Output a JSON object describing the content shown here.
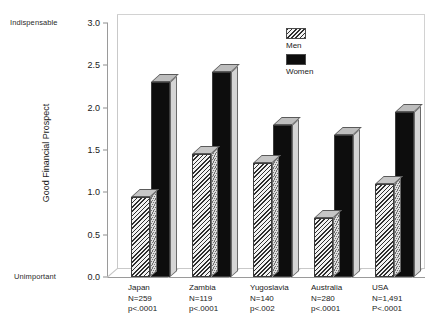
{
  "chart_data": {
    "type": "bar",
    "title": "",
    "xlabel": "",
    "ylabel": "Good Financial Prospect",
    "ylim": [
      0.0,
      3.0
    ],
    "ytick_labels": [
      "0.0",
      "0.5",
      "1.0",
      "1.5",
      "2.0",
      "2.5",
      "3.0"
    ],
    "ytick_values": [
      0.0,
      0.5,
      1.0,
      1.5,
      2.0,
      2.5,
      3.0
    ],
    "axis_low_anchor": "Unimportant",
    "axis_high_anchor": "Indispensable",
    "grid": false,
    "legend_position": "top-center-right",
    "categories": [
      "Japan",
      "Zambia",
      "Yugoslavia",
      "Australia",
      "USA"
    ],
    "series": [
      {
        "name": "Men",
        "values": [
          0.95,
          1.45,
          1.35,
          0.7,
          1.1
        ]
      },
      {
        "name": "Women",
        "values": [
          2.3,
          2.42,
          1.8,
          1.68,
          1.95
        ]
      }
    ],
    "annotations": [
      {
        "category": "Japan",
        "n": "N=259",
        "p": "p<.0001"
      },
      {
        "category": "Zambia",
        "n": "N=119",
        "p": "p<.0001"
      },
      {
        "category": "Yugoslavia",
        "n": "N=140",
        "p": "p<.002"
      },
      {
        "category": "Australia",
        "n": "N=280",
        "p": "p<.0001"
      },
      {
        "category": "USA",
        "n": "N=1,491",
        "p": "P<.0001"
      }
    ],
    "colors": {
      "men_fill": "#efefef",
      "men_hatch": "#2e2e2e",
      "women_fill": "#0d0d0d",
      "axis": "#9a9a9a",
      "background": "#ffffff"
    }
  },
  "legend": {
    "entries": [
      {
        "label": "Men"
      },
      {
        "label": "Women"
      }
    ]
  }
}
